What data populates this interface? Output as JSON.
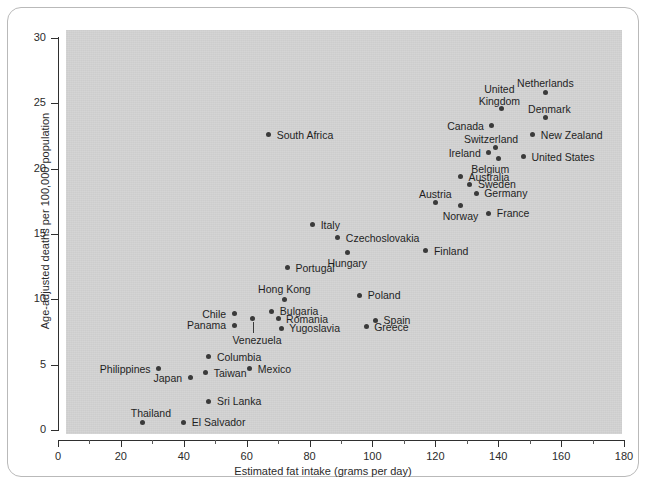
{
  "chart_data": {
    "type": "scatter",
    "title": "",
    "xlabel": "Estimated fat intake (grams per day)",
    "ylabel": "Age-adjusted deaths per 100,000 population",
    "xlim": [
      0,
      180
    ],
    "ylim": [
      0,
      30
    ],
    "xticks": [
      0,
      20,
      40,
      60,
      80,
      100,
      120,
      140,
      160,
      180
    ],
    "xtick_labels": [
      "0",
      "20",
      "40",
      "60",
      "80",
      "100",
      "120",
      "140",
      "160",
      "180"
    ],
    "x_minor_ticks": [
      10,
      30,
      50,
      70,
      90,
      110,
      130,
      150,
      170
    ],
    "yticks": [
      0,
      5,
      10,
      15,
      20,
      25,
      30
    ],
    "ytick_labels": [
      "0",
      "5",
      "10",
      "15",
      "20",
      "25",
      "30"
    ],
    "grid": false,
    "legend": "none",
    "panel_color": "#d2d2d2",
    "marker_color": "#3a3a3a",
    "points": [
      {
        "name": "Thailand",
        "x": 27,
        "y": 0.6,
        "label_pos": "above-left",
        "label_dx": 8,
        "label_dy": -14
      },
      {
        "name": "El Salvador",
        "x": 40,
        "y": 0.6,
        "label_pos": "right",
        "label_dx": 8,
        "label_dy": -5
      },
      {
        "name": "Sri Lanka",
        "x": 48,
        "y": 2.2,
        "label_pos": "right",
        "label_dx": 8,
        "label_dy": -5
      },
      {
        "name": "Japan",
        "x": 42,
        "y": 4.0,
        "label_pos": "left",
        "label_dx": -8,
        "label_dy": -5
      },
      {
        "name": "Philippines",
        "x": 32,
        "y": 4.7,
        "label_pos": "left",
        "label_dx": -8,
        "label_dy": -5
      },
      {
        "name": "Taiwan",
        "x": 47,
        "y": 4.4,
        "label_pos": "right",
        "label_dx": 8,
        "label_dy": -5
      },
      {
        "name": "Mexico",
        "x": 61,
        "y": 4.7,
        "label_pos": "right",
        "label_dx": 8,
        "label_dy": -5
      },
      {
        "name": "Columbia",
        "x": 48,
        "y": 5.6,
        "label_pos": "right",
        "label_dx": 8,
        "label_dy": -5
      },
      {
        "name": "Panama",
        "x": 56,
        "y": 8.0,
        "label_pos": "left",
        "label_dx": -8,
        "label_dy": -5
      },
      {
        "name": "Chile",
        "x": 56,
        "y": 8.9,
        "label_pos": "left",
        "label_dx": -8,
        "label_dy": -5
      },
      {
        "name": "Venezuela",
        "x": 62,
        "y": 8.5,
        "label_pos": "below",
        "label_dx": 4,
        "label_dy": 16,
        "leader": true
      },
      {
        "name": "Yugoslavia",
        "x": 71,
        "y": 7.8,
        "label_pos": "right",
        "label_dx": 8,
        "label_dy": -5
      },
      {
        "name": "Romania",
        "x": 70,
        "y": 8.5,
        "label_pos": "right",
        "label_dx": 8,
        "label_dy": -5
      },
      {
        "name": "Bulgaria",
        "x": 68,
        "y": 9.1,
        "label_pos": "right",
        "label_dx": 8,
        "label_dy": -5
      },
      {
        "name": "Hong Kong",
        "x": 72,
        "y": 10.0,
        "label_pos": "above",
        "label_dx": 0,
        "label_dy": -15
      },
      {
        "name": "Greece",
        "x": 98,
        "y": 7.9,
        "label_pos": "right",
        "label_dx": 8,
        "label_dy": -5
      },
      {
        "name": "Spain",
        "x": 101,
        "y": 8.4,
        "label_pos": "right",
        "label_dx": 8,
        "label_dy": -5
      },
      {
        "name": "Poland",
        "x": 96,
        "y": 10.3,
        "label_pos": "right",
        "label_dx": 8,
        "label_dy": -5
      },
      {
        "name": "Portugal",
        "x": 73,
        "y": 12.4,
        "label_pos": "right",
        "label_dx": 8,
        "label_dy": -5
      },
      {
        "name": "Hungary",
        "x": 92,
        "y": 13.6,
        "label_pos": "below",
        "label_dx": 0,
        "label_dy": 6
      },
      {
        "name": "Finland",
        "x": 117,
        "y": 13.7,
        "label_pos": "right",
        "label_dx": 8,
        "label_dy": -5
      },
      {
        "name": "Czechoslovakia",
        "x": 89,
        "y": 14.7,
        "label_pos": "right",
        "label_dx": 8,
        "label_dy": -5
      },
      {
        "name": "Italy",
        "x": 81,
        "y": 15.7,
        "label_pos": "right",
        "label_dx": 8,
        "label_dy": -5
      },
      {
        "name": "France",
        "x": 137,
        "y": 16.6,
        "label_pos": "right",
        "label_dx": 8,
        "label_dy": -5
      },
      {
        "name": "Norway",
        "x": 128,
        "y": 17.2,
        "label_pos": "below",
        "label_dx": 0,
        "label_dy": 6
      },
      {
        "name": "Austria",
        "x": 120,
        "y": 17.4,
        "label_pos": "above",
        "label_dx": 0,
        "label_dy": -14
      },
      {
        "name": "Germany",
        "x": 133,
        "y": 18.1,
        "label_pos": "right",
        "label_dx": 8,
        "label_dy": -5
      },
      {
        "name": "Sweden",
        "x": 131,
        "y": 18.8,
        "label_pos": "right",
        "label_dx": 8,
        "label_dy": -5
      },
      {
        "name": "Australia",
        "x": 128,
        "y": 19.4,
        "label_pos": "right",
        "label_dx": 8,
        "label_dy": -5
      },
      {
        "name": "Belgium",
        "x": 140,
        "y": 20.8,
        "label_pos": "below",
        "label_dx": -8,
        "label_dy": 6
      },
      {
        "name": "Ireland",
        "x": 137,
        "y": 21.2,
        "label_pos": "left",
        "label_dx": -8,
        "label_dy": -5
      },
      {
        "name": "Switzerland",
        "x": 139,
        "y": 21.6,
        "label_pos": "above",
        "label_dx": -4,
        "label_dy": -14
      },
      {
        "name": "United States",
        "x": 148,
        "y": 20.9,
        "label_pos": "right",
        "label_dx": 8,
        "label_dy": -5
      },
      {
        "name": "New Zealand",
        "x": 151,
        "y": 22.6,
        "label_pos": "right",
        "label_dx": 8,
        "label_dy": -5
      },
      {
        "name": "Canada",
        "x": 138,
        "y": 23.3,
        "label_pos": "left",
        "label_dx": -8,
        "label_dy": -5
      },
      {
        "name": "Denmark",
        "x": 155,
        "y": 23.9,
        "label_pos": "above",
        "label_dx": 4,
        "label_dy": -14
      },
      {
        "name": "United Kingdom",
        "x": 141,
        "y": 24.6,
        "label_pos": "above",
        "label_dx": -2,
        "label_dy": -26
      },
      {
        "name": "Netherlands",
        "x": 155,
        "y": 25.8,
        "label_pos": "above",
        "label_dx": 0,
        "label_dy": -15
      },
      {
        "name": "South Africa",
        "x": 67,
        "y": 22.6,
        "label_pos": "right",
        "label_dx": 8,
        "label_dy": -5
      }
    ]
  }
}
